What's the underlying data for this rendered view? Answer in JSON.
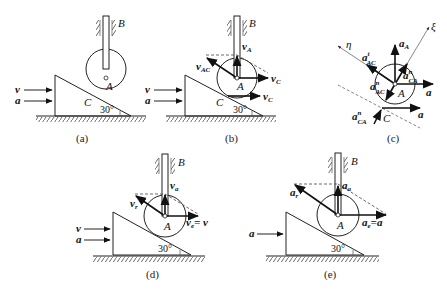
{
  "figure": {
    "panels": [
      {
        "id": "a",
        "caption": "(a)",
        "labels": {
          "rod": "B",
          "center": "A",
          "contact": "C",
          "angle": "30°",
          "v": "v",
          "a": "a"
        }
      },
      {
        "id": "b",
        "caption": "(b)",
        "labels": {
          "rod": "B",
          "center": "A",
          "contact": "C",
          "angle": "30°",
          "v": "v",
          "a": "a",
          "vA": "v",
          "vA_sub": "A",
          "vAC": "v",
          "vAC_sub": "AC",
          "vC_center": "v",
          "vC_center_sub": "C",
          "vC_contact": "v",
          "vC_contact_sub": "C"
        }
      },
      {
        "id": "c",
        "caption": "(c)",
        "labels": {
          "xi": "ξ",
          "eta": "η",
          "center": "A",
          "contact": "C",
          "aA": "a",
          "aA_sub": "A",
          "aAC_t": "a",
          "aAC_t_sup": "t",
          "aAC_t_sub": "AC",
          "aCA_n_center": "a",
          "aCA_n_center_sup": "n",
          "aCA_n_center_sub": "CA",
          "aAC_n": "a",
          "aAC_n_sup": "n",
          "aAC_n_sub": "AC",
          "a_center": "a",
          "aCA_n_contact": "a",
          "aCA_n_contact_sup": "n",
          "aCA_n_contact_sub": "CA",
          "a_contact": "a"
        }
      },
      {
        "id": "d",
        "caption": "(d)",
        "labels": {
          "rod": "B",
          "center": "A",
          "angle": "30°",
          "v": "v",
          "a": "a",
          "va": "v",
          "va_sub": "a",
          "vr": "v",
          "vr_sub": "r",
          "ve": "v",
          "ve_sub": "e",
          "ve_eq": "= v"
        }
      },
      {
        "id": "e",
        "caption": "(e)",
        "labels": {
          "rod": "B",
          "center": "A",
          "angle": "30°",
          "a": "a",
          "aa": "a",
          "aa_sub": "a",
          "ar": "a",
          "ar_sub": "r",
          "ae": "a",
          "ae_sub": "e",
          "ae_eq": "=a"
        }
      }
    ]
  }
}
